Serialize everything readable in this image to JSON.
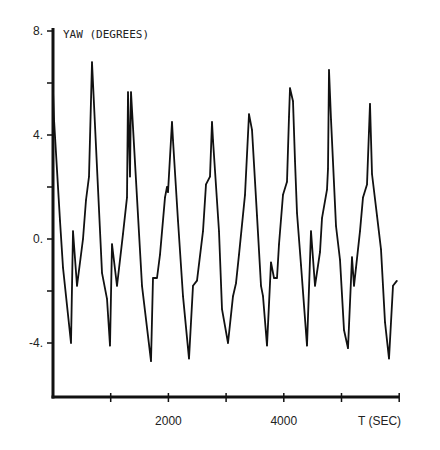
{
  "chart_data": {
    "type": "line",
    "title": "YAW (DEGREES)",
    "xlabel": "T (SEC)",
    "ylabel": "YAW (DEGREES)",
    "xlim": [
      0,
      6000
    ],
    "ylim": [
      -6,
      8
    ],
    "x_ticks": [
      1000,
      2000,
      3000,
      4000,
      5000,
      6000
    ],
    "x_tick_labels": [
      {
        "value": 2000,
        "label": "2000"
      },
      {
        "value": 4000,
        "label": "4000"
      }
    ],
    "y_ticks": [
      8,
      6,
      4,
      2,
      0,
      -2,
      -4
    ],
    "y_tick_labels": [
      {
        "value": 8,
        "label": "8."
      },
      {
        "value": 4,
        "label": "4."
      },
      {
        "value": 0,
        "label": "0."
      },
      {
        "value": -4,
        "label": "-4."
      }
    ],
    "grid": false,
    "series": [
      {
        "name": "yaw",
        "color": "#111111",
        "x": [
          0,
          17,
          121,
          173,
          312,
          347,
          416,
          520,
          572,
          624,
          676,
          849,
          936,
          988,
          1023,
          1109,
          1213,
          1282,
          1300,
          1334,
          1352,
          1542,
          1698,
          1733,
          1802,
          1854,
          1941,
          1976,
          1993,
          2062,
          2080,
          2166,
          2253,
          2357,
          2426,
          2496,
          2600,
          2652,
          2721,
          2756,
          2773,
          2877,
          2929,
          3033,
          3120,
          3172,
          3224,
          3328,
          3397,
          3449,
          3536,
          3605,
          3640,
          3709,
          3778,
          3830,
          3882,
          3917,
          3986,
          4055,
          4090,
          4108,
          4159,
          4194,
          4229,
          4298,
          4402,
          4471,
          4541,
          4627,
          4662,
          4749,
          4766,
          4783,
          4818,
          4905,
          4974,
          5043,
          5113,
          5182,
          5217,
          5251,
          5321,
          5373,
          5442,
          5494,
          5529,
          5615,
          5685,
          5754,
          5823,
          5893,
          5962
        ],
        "y": [
          5.7,
          4.6,
          0.7,
          -1.1,
          -4.0,
          0.3,
          -1.8,
          0.0,
          1.5,
          2.4,
          6.8,
          -1.3,
          -2.3,
          -4.1,
          -0.2,
          -1.8,
          0.2,
          1.6,
          5.65,
          2.4,
          5.65,
          -1.8,
          -4.7,
          -1.5,
          -1.5,
          -0.6,
          1.6,
          2.0,
          1.8,
          4.5,
          3.8,
          0.7,
          -2.2,
          -4.6,
          -1.8,
          -1.6,
          0.3,
          2.1,
          2.4,
          4.5,
          3.8,
          0.3,
          -2.7,
          -4.0,
          -2.2,
          -1.7,
          -0.6,
          1.7,
          4.8,
          4.2,
          0.9,
          -1.8,
          -2.2,
          -4.1,
          -0.9,
          -1.5,
          -1.5,
          -0.2,
          1.7,
          2.2,
          4.7,
          5.8,
          5.3,
          3.0,
          1.0,
          -1.0,
          -4.1,
          0.3,
          -1.8,
          -0.5,
          0.8,
          1.9,
          2.7,
          6.5,
          4.6,
          0.5,
          -0.8,
          -3.5,
          -4.2,
          -0.7,
          -1.8,
          -1.1,
          0.3,
          1.6,
          2.1,
          5.2,
          2.5,
          0.9,
          -0.4,
          -3.2,
          -4.6,
          -1.8,
          -1.6
        ]
      }
    ]
  }
}
